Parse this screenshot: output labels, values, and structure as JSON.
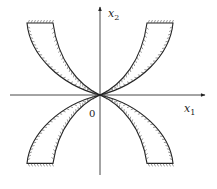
{
  "diagram": {
    "axes": {
      "x_label_main": "x",
      "x_label_sub": "1",
      "y_label_main": "x",
      "y_label_sub": "2",
      "origin_label": "0"
    },
    "regions": [
      {
        "name": "upper-left-region",
        "quadrant": "II"
      },
      {
        "name": "upper-right-region",
        "quadrant": "I"
      },
      {
        "name": "lower-left-region",
        "quadrant": "III"
      },
      {
        "name": "lower-right-region",
        "quadrant": "IV"
      }
    ],
    "boundary_style": "hatched",
    "colors": {
      "line": "#222222",
      "hatch": "#555555",
      "background": "#ffffff"
    }
  }
}
